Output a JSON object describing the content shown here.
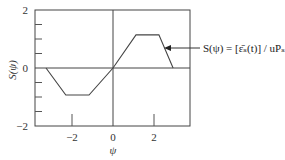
{
  "chart_data": {
    "type": "line",
    "title": "",
    "xlabel": "ψ",
    "ylabel": "S(ψ)",
    "xlim": [
      -3.7,
      3.75
    ],
    "ylim": [
      -2,
      2
    ],
    "xticks": [
      -2,
      0,
      2
    ],
    "xtick_labels": [
      "−2",
      "0",
      "2"
    ],
    "yticks": [
      -2,
      0,
      2
    ],
    "ytick_labels": [
      "−2",
      "0",
      "2"
    ],
    "y_minor_ticks": [
      -1.5,
      -1,
      -0.5,
      0.5,
      1,
      1.5
    ],
    "grid": false,
    "reference_lines": {
      "horizontal_at_y": 0,
      "vertical_at_x": 0
    },
    "series": [
      {
        "name": "S(ψ)",
        "x": [
          -3.27,
          -2.3,
          -1.17,
          0,
          1.12,
          2.24,
          2.93
        ],
        "y": [
          0,
          -0.93,
          -0.93,
          0,
          1.14,
          1.14,
          0
        ]
      }
    ],
    "annotations": [
      {
        "text": "S(ψ) = [ε̄ₛ(t)] / uPₛ",
        "points_to": {
          "x": 2.6,
          "y": 0.7
        },
        "arrow": true
      }
    ]
  }
}
